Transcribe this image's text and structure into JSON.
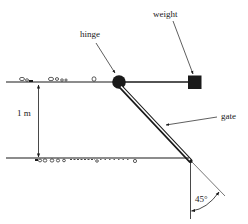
{
  "diagram": {
    "type": "physics-schematic",
    "labels": {
      "weight": "weight",
      "hinge": "hinge",
      "gate": "gate",
      "depth": "1 m",
      "angle": "45°"
    },
    "colors": {
      "ink": "#1a1a1a",
      "background": "#ffffff"
    }
  }
}
